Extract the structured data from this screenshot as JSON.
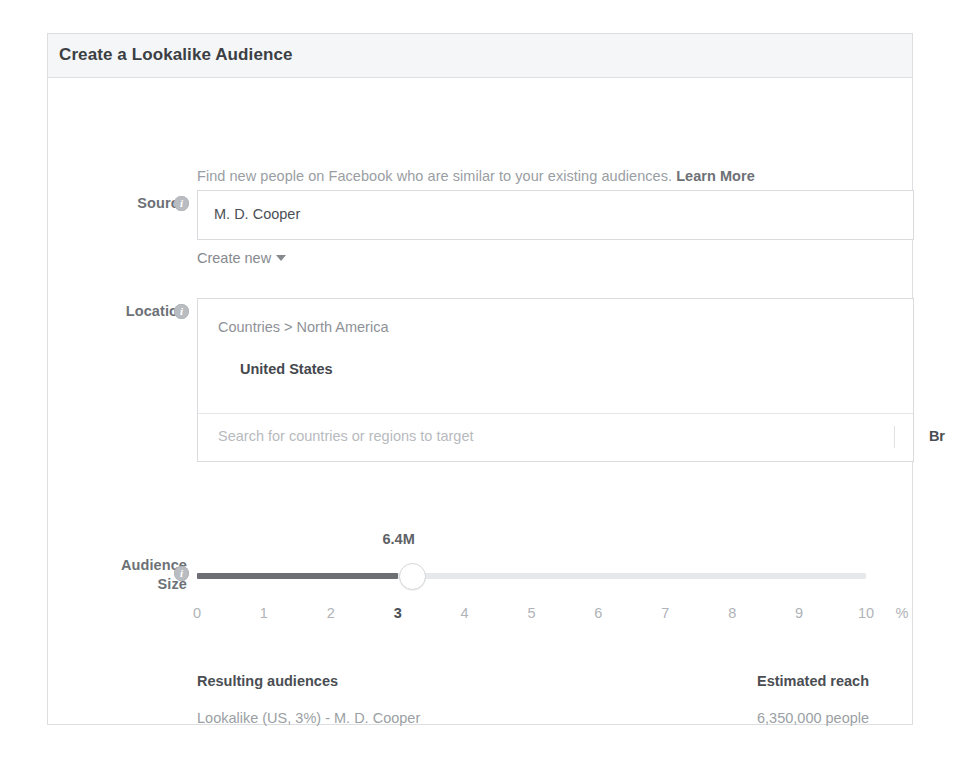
{
  "dialog": {
    "title": "Create a Lookalike Audience",
    "intro": {
      "text": "Find new people on Facebook who are similar to your existing audiences.",
      "link_label": "Learn More"
    },
    "fields": {
      "source": {
        "label": "Source",
        "info_icon": "info-icon",
        "value": "M. D. Cooper",
        "create_new_label": "Create new",
        "caret_icon": "chevron-down-icon"
      },
      "location": {
        "label": "Location",
        "info_icon": "info-icon",
        "breadcrumb": "Countries > North America",
        "selected": "United States",
        "search_placeholder": "Search for countries or regions to target",
        "browse_label": "Br"
      },
      "audience_size": {
        "label_line1": "Audience",
        "label_line2": "Size",
        "info_icon": "info-icon",
        "value_label": "6.4M",
        "selected_tick": "3",
        "ticks": [
          "0",
          "1",
          "2",
          "3",
          "4",
          "5",
          "6",
          "7",
          "8",
          "9",
          "10"
        ],
        "unit": "%"
      }
    },
    "results": {
      "resulting_audiences_header": "Resulting audiences",
      "resulting_audiences_value": "Lookalike (US, 3%) - M. D. Cooper",
      "estimated_reach_header": "Estimated reach",
      "estimated_reach_value": "6,350,000 people"
    },
    "colors": {
      "header_bg": "#f5f6f7",
      "border": "#dcdee1",
      "text_dark": "#4a4e53",
      "text_muted": "#9a9ea3",
      "slider_fill": "#6b6e72",
      "slider_track": "#e7e8ea"
    }
  }
}
